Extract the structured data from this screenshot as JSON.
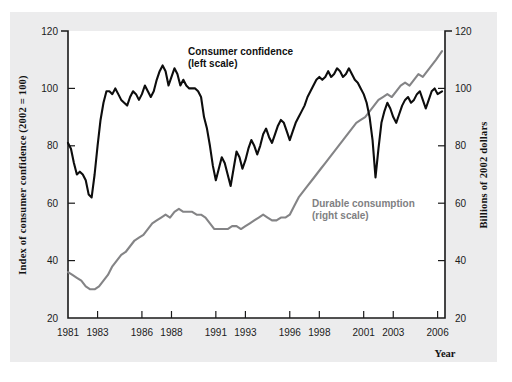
{
  "figure": {
    "panel_bg": "#ececed",
    "plot_bg": "#ffffff"
  },
  "chart_data": {
    "type": "line",
    "title": "",
    "xlabel": "Year",
    "grid": false,
    "legend_position": "inline-annotations",
    "xlim": [
      1981,
      2006.5
    ],
    "xticks": [
      1981,
      1983,
      1986,
      1988,
      1991,
      1993,
      1996,
      1998,
      2001,
      2003,
      2006
    ],
    "xtick_labels": [
      "1981",
      "1983",
      "1986",
      "1988",
      "1991",
      "1993",
      "1996",
      "1998",
      "2001",
      "2003",
      "2006"
    ],
    "left_axis": {
      "label": "Index of consumer confidence (2002 = 100)",
      "ylim": [
        20,
        120
      ],
      "yticks": [
        20,
        40,
        60,
        80,
        100,
        120
      ],
      "ytick_labels": [
        "20",
        "40",
        "60",
        "80",
        "100",
        "120"
      ]
    },
    "right_axis": {
      "label": "Billions of 2002 dollars",
      "ylim": [
        20,
        120
      ],
      "yticks": [
        20,
        40,
        60,
        80,
        100,
        120
      ],
      "ytick_labels": [
        "20",
        "40",
        "60",
        "80",
        "100",
        "120"
      ]
    },
    "annotations": [
      {
        "text_line1": "Consumer confidence",
        "text_line2": "(left scale)",
        "color": "#101010"
      },
      {
        "text_line1": "Durable consumption",
        "text_line2": "(right scale)",
        "color": "#808082"
      }
    ],
    "series": [
      {
        "name": "Consumer confidence (left scale)",
        "axis": "left",
        "color": "#0d0d0d",
        "x": [
          1981.0,
          1981.2,
          1981.4,
          1981.6,
          1981.8,
          1982.0,
          1982.2,
          1982.4,
          1982.6,
          1982.8,
          1983.0,
          1983.2,
          1983.4,
          1983.6,
          1983.8,
          1984.0,
          1984.2,
          1984.4,
          1984.6,
          1984.8,
          1985.0,
          1985.2,
          1985.4,
          1985.6,
          1985.8,
          1986.0,
          1986.2,
          1986.4,
          1986.6,
          1986.8,
          1987.0,
          1987.2,
          1987.4,
          1987.6,
          1987.8,
          1988.0,
          1988.2,
          1988.4,
          1988.6,
          1988.8,
          1989.0,
          1989.2,
          1989.4,
          1989.6,
          1989.8,
          1990.0,
          1990.2,
          1990.4,
          1990.6,
          1990.8,
          1991.0,
          1991.2,
          1991.4,
          1991.6,
          1991.8,
          1992.0,
          1992.2,
          1992.4,
          1992.6,
          1992.8,
          1993.0,
          1993.2,
          1993.4,
          1993.6,
          1993.8,
          1994.0,
          1994.2,
          1994.4,
          1994.6,
          1994.8,
          1995.0,
          1995.2,
          1995.4,
          1995.6,
          1995.8,
          1996.0,
          1996.2,
          1996.4,
          1996.6,
          1996.8,
          1997.0,
          1997.2,
          1997.4,
          1997.6,
          1997.8,
          1998.0,
          1998.2,
          1998.4,
          1998.6,
          1998.8,
          1999.0,
          1999.2,
          1999.4,
          1999.6,
          1999.8,
          2000.0,
          2000.2,
          2000.4,
          2000.6,
          2000.8,
          2001.0,
          2001.2,
          2001.4,
          2001.6,
          2001.8,
          2002.0,
          2002.2,
          2002.4,
          2002.6,
          2002.8,
          2003.0,
          2003.2,
          2003.4,
          2003.6,
          2003.8,
          2004.0,
          2004.2,
          2004.4,
          2004.6,
          2004.8,
          2005.0,
          2005.2,
          2005.4,
          2005.6,
          2005.8,
          2006.0,
          2006.3
        ],
        "values": [
          81,
          79,
          74,
          70,
          71,
          70,
          68,
          63,
          62,
          70,
          80,
          89,
          95,
          99,
          99,
          98,
          100,
          98,
          96,
          95,
          94,
          97,
          99,
          98,
          96,
          98,
          101,
          99,
          97,
          99,
          103,
          106,
          108,
          106,
          101,
          104,
          107,
          105,
          101,
          103,
          101,
          100,
          100,
          100,
          99,
          97,
          90,
          86,
          80,
          73,
          68,
          72,
          76,
          74,
          70,
          66,
          72,
          78,
          76,
          72,
          75,
          79,
          82,
          80,
          77,
          80,
          84,
          86,
          83,
          81,
          84,
          87,
          89,
          88,
          85,
          82,
          85,
          88,
          90,
          92,
          94,
          97,
          99,
          101,
          103,
          104,
          103,
          104,
          106,
          104,
          105,
          107,
          106,
          104,
          105,
          107,
          105,
          103,
          102,
          100,
          98,
          95,
          90,
          82,
          69,
          79,
          88,
          92,
          95,
          93,
          90,
          88,
          91,
          94,
          96,
          97,
          95,
          96,
          98,
          99,
          96,
          93,
          96,
          99,
          100,
          98,
          99
        ]
      },
      {
        "name": "Durable consumption (right scale)",
        "axis": "right",
        "color": "#848486",
        "x": [
          1981.0,
          1981.3,
          1981.6,
          1981.9,
          1982.2,
          1982.5,
          1982.8,
          1983.1,
          1983.4,
          1983.7,
          1984.0,
          1984.3,
          1984.6,
          1984.9,
          1985.2,
          1985.5,
          1985.8,
          1986.1,
          1986.4,
          1986.7,
          1987.0,
          1987.3,
          1987.6,
          1987.9,
          1988.2,
          1988.5,
          1988.8,
          1989.1,
          1989.4,
          1989.7,
          1990.0,
          1990.3,
          1990.6,
          1990.9,
          1991.2,
          1991.5,
          1991.8,
          1992.1,
          1992.4,
          1992.7,
          1993.0,
          1993.3,
          1993.6,
          1993.9,
          1994.2,
          1994.5,
          1994.8,
          1995.1,
          1995.4,
          1995.7,
          1996.0,
          1996.3,
          1996.6,
          1996.9,
          1997.2,
          1997.5,
          1997.8,
          1998.1,
          1998.4,
          1998.7,
          1999.0,
          1999.3,
          1999.6,
          1999.9,
          2000.2,
          2000.5,
          2000.8,
          2001.1,
          2001.4,
          2001.7,
          2002.0,
          2002.3,
          2002.6,
          2002.9,
          2003.2,
          2003.5,
          2003.8,
          2004.1,
          2004.4,
          2004.7,
          2005.0,
          2005.3,
          2005.6,
          2005.9,
          2006.3
        ],
        "values": [
          36,
          35,
          34,
          33,
          31,
          30,
          30,
          31,
          33,
          35,
          38,
          40,
          42,
          43,
          45,
          47,
          48,
          49,
          51,
          53,
          54,
          55,
          56,
          55,
          57,
          58,
          57,
          57,
          57,
          56,
          56,
          55,
          53,
          51,
          51,
          51,
          51,
          52,
          52,
          51,
          52,
          53,
          54,
          55,
          56,
          55,
          54,
          54,
          55,
          55,
          56,
          59,
          62,
          64,
          66,
          68,
          70,
          72,
          74,
          76,
          78,
          80,
          82,
          84,
          86,
          88,
          89,
          90,
          92,
          94,
          96,
          97,
          98,
          97,
          99,
          101,
          102,
          101,
          103,
          105,
          104,
          106,
          108,
          110,
          113
        ]
      }
    ]
  },
  "axis_titles": {
    "left": "Index of consumer confidence (2002 = 100)",
    "right": "Billions of 2002 dollars",
    "bottom": "Year"
  },
  "annotations": {
    "confidence": {
      "line1": "Consumer confidence",
      "line2": "(left scale)"
    },
    "durable": {
      "line1": "Durable consumption",
      "line2": "(right scale)"
    }
  }
}
